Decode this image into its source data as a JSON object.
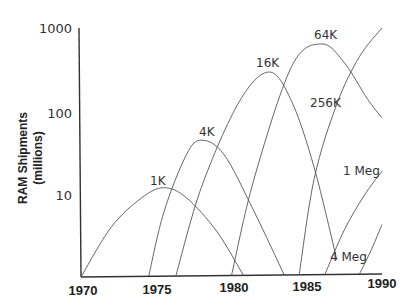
{
  "chart_data": {
    "type": "line",
    "title": "",
    "xlabel": "",
    "ylabel": "RAM Shipments (millions)",
    "ylabel_lines": [
      "RAM Shipments",
      "(millions)"
    ],
    "yscale": "log",
    "ylim": [
      1,
      1000
    ],
    "xlim": [
      1970,
      1990
    ],
    "grid": false,
    "legend": "inline labels",
    "x_ticks": [
      "1970",
      "1975",
      "1980",
      "1985",
      "1990"
    ],
    "y_ticks": [
      "10",
      "100",
      "1000"
    ],
    "series": [
      {
        "name": "1K",
        "x": [
          1970,
          1972,
          1974,
          1975.5,
          1977,
          1979,
          1980.8
        ],
        "y": [
          1,
          4,
          9,
          12,
          9,
          3.5,
          1
        ]
      },
      {
        "name": "4K",
        "x": [
          1974.5,
          1975.5,
          1977,
          1978,
          1979.5,
          1981.5,
          1983.5
        ],
        "y": [
          1,
          6,
          30,
          45,
          30,
          6,
          1
        ]
      },
      {
        "name": "16K",
        "x": [
          1976.3,
          1978,
          1980.5,
          1982.5,
          1984,
          1985.5,
          1987
        ],
        "y": [
          1,
          12,
          130,
          300,
          130,
          20,
          1.5
        ]
      },
      {
        "name": "64K",
        "x": [
          1980,
          1981.5,
          1984,
          1986,
          1987.5,
          1989,
          1990
        ],
        "y": [
          1,
          15,
          350,
          650,
          380,
          140,
          80
        ]
      },
      {
        "name": "256K",
        "x": [
          1984.5,
          1985.5,
          1987,
          1988.5,
          1990
        ],
        "y": [
          1,
          15,
          120,
          450,
          1000
        ]
      },
      {
        "name": "1 Meg",
        "x": [
          1986.2,
          1987.5,
          1988.8,
          1990
        ],
        "y": [
          1,
          3.5,
          9,
          18
        ]
      },
      {
        "name": "4 Meg",
        "x": [
          1988.5,
          1989.3,
          1990
        ],
        "y": [
          1,
          2,
          4
        ]
      }
    ]
  }
}
